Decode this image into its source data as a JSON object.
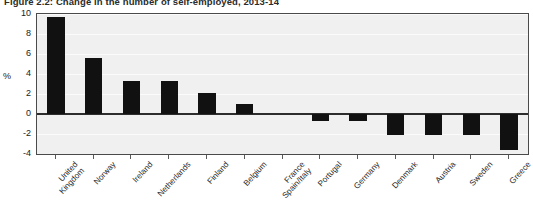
{
  "figure": {
    "title": "Figure 2.2: Change in the number of self-employed, 2013-14",
    "y_unit_label": "%"
  },
  "chart_data": {
    "type": "bar",
    "title": "Figure 2.2: Change in the number of self-employed, 2013-14",
    "xlabel": "",
    "ylabel": "%",
    "ylim": [
      -4,
      10
    ],
    "yticks": [
      10,
      8,
      6,
      4,
      2,
      0,
      -2,
      -4
    ],
    "ytick_labels": [
      "10",
      "8",
      "6",
      "4",
      "2",
      "0",
      "-2",
      "-4"
    ],
    "grid": true,
    "legend": false,
    "bar_color": "#111111",
    "plot_background": "#f0f0f0",
    "categories": [
      "United\nKingdom",
      "Norway",
      "Ireland",
      "Netherlands",
      "Finland",
      "Belgium",
      "France\nSpain/Italy",
      "Portugal",
      "Germany",
      "Denmark",
      "Austria",
      "Sweden",
      "Greece"
    ],
    "values": [
      9.7,
      5.6,
      3.3,
      3.3,
      2.1,
      1.0,
      0.0,
      -0.7,
      -0.7,
      -2.1,
      -2.1,
      -2.1,
      -3.6
    ]
  }
}
